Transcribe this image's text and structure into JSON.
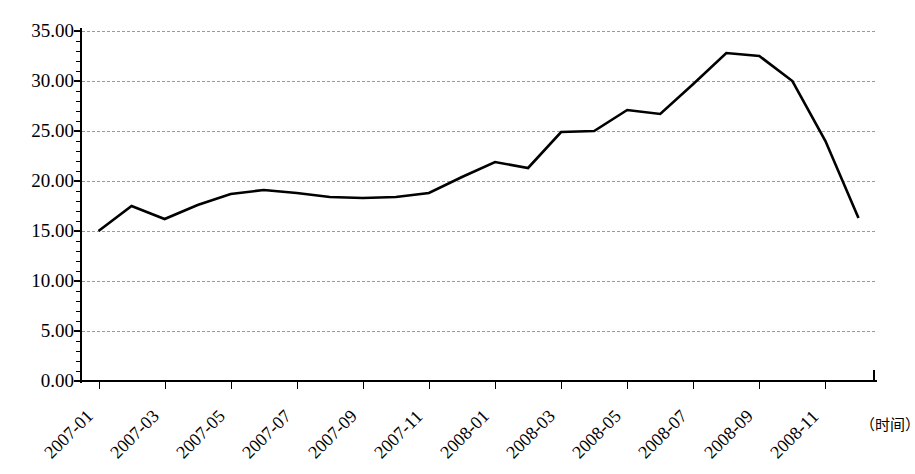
{
  "chart_data": {
    "type": "line",
    "title": "",
    "subtitle": "",
    "xlabel": "（时间）",
    "ylabel": "",
    "ylim": [
      0,
      35
    ],
    "ytick_step": 5,
    "ytick_minor_step": 1,
    "grid": true,
    "grid_style": "dashed",
    "legend": false,
    "legend_position": "none",
    "line_color": "#000000",
    "x": [
      "2007-01",
      "2007-02",
      "2007-03",
      "2007-04",
      "2007-05",
      "2007-06",
      "2007-07",
      "2007-08",
      "2007-09",
      "2007-10",
      "2007-11",
      "2007-12",
      "2008-01",
      "2008-02",
      "2008-03",
      "2008-04",
      "2008-05",
      "2008-06",
      "2008-07",
      "2008-08",
      "2008-09",
      "2008-10",
      "2008-11",
      "2008-12"
    ],
    "values": [
      15.0,
      17.5,
      16.2,
      17.6,
      18.7,
      19.1,
      18.8,
      18.4,
      18.3,
      18.4,
      18.8,
      20.4,
      21.9,
      21.3,
      24.9,
      25.0,
      27.1,
      26.7,
      29.7,
      32.8,
      32.5,
      30.0,
      24.0,
      16.3
    ],
    "xtick_labels": [
      "2007-01",
      "2007-03",
      "2007-05",
      "2007-07",
      "2007-09",
      "2007-11",
      "2008-01",
      "2008-03",
      "2008-05",
      "2008-07",
      "2008-09",
      "2008-11"
    ],
    "ytick_labels": [
      "35.00",
      "30.00",
      "25.00",
      "20.00",
      "15.00",
      "10.00",
      "5.00",
      "0.00"
    ],
    "ytick_values": [
      35,
      30,
      25,
      20,
      15,
      10,
      5,
      0
    ]
  },
  "caption": {
    "text": ""
  }
}
